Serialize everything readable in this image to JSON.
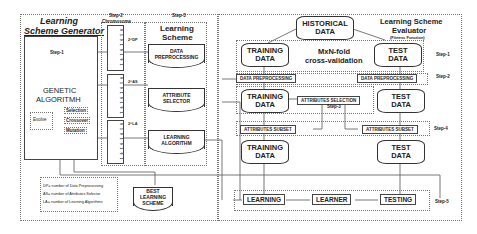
{
  "generator": {
    "title_line1": "Learning",
    "title_line2": "Scheme Generator",
    "step": "Step-1",
    "ga_line1": "GENETIC",
    "ga_line2": "ALGORITMH",
    "evolve": "Evolve",
    "operators": [
      "Selection",
      "Crossover",
      "Mutation"
    ],
    "legend": [
      "DP= number of  Data Preprocessing",
      "AS= number of  Attributes Selector",
      "LA= number of  Learning Algorithms"
    ],
    "best_scheme": [
      "BEST",
      "LEARNING",
      "SCHEME"
    ]
  },
  "chromosome": {
    "step": "Step-2",
    "title": "Chromosome",
    "bits": "0 1 0 1 0 1 0 1",
    "labels": [
      "2^DP",
      "2^AS",
      "2^LA"
    ]
  },
  "scheme": {
    "step": "Step-3",
    "title_line1": "Learning",
    "title_line2": "Scheme",
    "items": [
      [
        "DATA",
        "PREPROCESSING"
      ],
      [
        "ATTRIBUTE",
        "SELECTOR"
      ],
      [
        "LEARNING",
        "ALGORITHM"
      ]
    ]
  },
  "evaluator": {
    "title_line1": "Learning Scheme",
    "title_line2": "Evaluator",
    "subtitle": "(Fitness Function)",
    "historical": [
      "HISTORICAL",
      "DATA"
    ],
    "cv_line1": "MxN-fold",
    "cv_line2": "cross-validation",
    "training": [
      "TRAINING",
      "DATA"
    ],
    "test": [
      "TEST",
      "DATA"
    ],
    "data_preprocessing": "DATA PREPROCESSING",
    "attributes_selection": "ATTRIBUTES SELECTION",
    "attributes_subset": "ATTRIBUTES SUBSET",
    "learning": "LEARNING",
    "learner": "LEARNER",
    "testing": "TESTING",
    "steps": [
      "Step-1",
      "Step-2",
      "Step-3",
      "Step-4",
      "Step-5"
    ]
  }
}
